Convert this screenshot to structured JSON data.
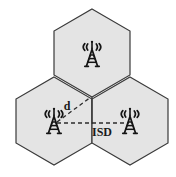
{
  "figure": {
    "background_color": "#ffffff"
  },
  "cells": [
    {
      "id": "top-cell",
      "name": "top-hexagon",
      "center_x": 92,
      "center_y": 53,
      "radius": 44,
      "fill": "#e4e4e4",
      "stroke": "#3a3a3a"
    },
    {
      "id": "bottom-left-cell",
      "name": "bottom-left-hexagon",
      "center_x": 54,
      "center_y": 121,
      "radius": 44,
      "fill": "#e4e4e4",
      "stroke": "#3a3a3a"
    },
    {
      "id": "bottom-right-cell",
      "name": "bottom-right-hexagon",
      "center_x": 130,
      "center_y": 121,
      "radius": 44,
      "fill": "#e4e4e4",
      "stroke": "#3a3a3a"
    }
  ],
  "towers": [
    {
      "id": "tower-top",
      "name": "cell-tower-top",
      "x": 92,
      "y": 57,
      "scale": 1.0
    },
    {
      "id": "tower-bottom-left",
      "name": "cell-tower-bottom-left",
      "x": 54,
      "y": 124,
      "scale": 1.0
    },
    {
      "id": "tower-bottom-right",
      "name": "cell-tower-bottom-right",
      "x": 130,
      "y": 124,
      "scale": 1.0
    }
  ],
  "measurements": [
    {
      "id": "cell-radius",
      "label": "d",
      "kind": "diagonal-dashed",
      "x1": 57,
      "y1": 122,
      "x2": 92,
      "y2": 96,
      "label_x": 67,
      "label_y": 108,
      "stroke": "#2b2b2b",
      "dash": "4 3"
    },
    {
      "id": "inter-site-distance",
      "label": "ISD",
      "kind": "horizontal-dashed",
      "x1": 57,
      "y1": 123,
      "x2": 127,
      "y2": 123,
      "label_x": 102,
      "label_y": 135,
      "stroke": "#2b2b2b",
      "dash": "4 3"
    }
  ],
  "vertex_marker": {
    "name": "shared-vertex-drop-line",
    "x": 92,
    "y1": 96,
    "y2": 124,
    "stroke": "#3a3a3a"
  },
  "colors": {
    "cell_fill": "#e4e4e4",
    "cell_stroke": "#3a3a3a",
    "line": "#2b2b2b",
    "text": "#1a1a1a",
    "background": "#ffffff"
  }
}
